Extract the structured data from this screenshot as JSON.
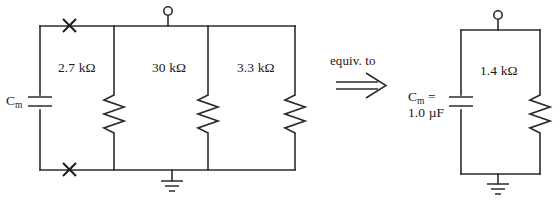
{
  "figure": {
    "relation_text": "equiv. to",
    "relation_arrow": "double-right-arrow"
  },
  "left_circuit": {
    "name": "original-circuit",
    "capacitor": {
      "label": "C",
      "subscript": "m",
      "symbol": "capacitor-symbol"
    },
    "terminal": {
      "symbol": "open-circle-terminal"
    },
    "ground": {
      "symbol": "ground-symbol"
    },
    "node_marks": [
      {
        "symbol": "x-mark",
        "position": "top"
      },
      {
        "symbol": "x-mark",
        "position": "bottom"
      }
    ],
    "resistors": [
      {
        "label": "2.7 kΩ",
        "value": 2.7,
        "unit": "kΩ"
      },
      {
        "label": "30 kΩ",
        "value": 30,
        "unit": "kΩ"
      },
      {
        "label": "3.3 kΩ",
        "value": 3.3,
        "unit": "kΩ"
      }
    ]
  },
  "right_circuit": {
    "name": "equivalent-circuit",
    "capacitor": {
      "label_line1_prefix": "C",
      "label_line1_subscript": "m",
      "label_line1_suffix": " =",
      "label_line2": "1.0 µF",
      "value": 1.0,
      "unit": "µF",
      "symbol": "capacitor-symbol"
    },
    "terminal": {
      "symbol": "open-circle-terminal"
    },
    "ground": {
      "symbol": "ground-symbol"
    },
    "resistor": {
      "label": "1.4 kΩ",
      "value": 1.4,
      "unit": "kΩ"
    }
  },
  "colors": {
    "ink": "#2b2b2b",
    "background": "#ffffff"
  }
}
